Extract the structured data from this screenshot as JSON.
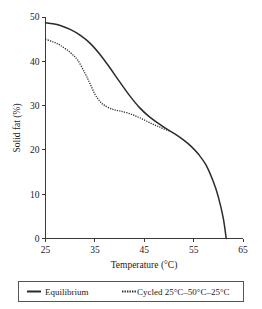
{
  "chart_data": {
    "type": "line",
    "title": "",
    "xlabel": "Temperature (°C)",
    "ylabel": "Solid fat (%)",
    "xlim": [
      25,
      65
    ],
    "ylim": [
      0,
      50
    ],
    "xticks": [
      25,
      35,
      45,
      55,
      65
    ],
    "yticks": [
      0,
      10,
      20,
      30,
      40,
      50
    ],
    "xtick_labels": [
      "25",
      "35",
      "45",
      "55",
      "65"
    ],
    "ytick_labels": [
      "0",
      "10",
      "20",
      "30",
      "40",
      "50"
    ],
    "grid": false,
    "legend_position": "below-axes",
    "series": [
      {
        "name": "Equilibrium",
        "style": "solid",
        "color": "#2b2b2b",
        "x": [
          25.0,
          26.5,
          28.0,
          30.0,
          32.0,
          34.0,
          36.0,
          38.0,
          40.0,
          42.0,
          44.0,
          46.0,
          48.0,
          50.0,
          51.5,
          53.0,
          54.5,
          56.0,
          57.5,
          59.0,
          60.0,
          61.0,
          61.6
        ],
        "y": [
          48.7,
          48.5,
          48.1,
          47.2,
          45.9,
          44.1,
          41.6,
          38.6,
          35.4,
          32.3,
          29.6,
          27.5,
          25.9,
          24.4,
          23.4,
          22.2,
          20.8,
          19.0,
          16.6,
          12.8,
          9.4,
          4.6,
          0.0
        ]
      },
      {
        "name": "Cycled 25°C–50°C–25°C",
        "style": "dotted",
        "color": "#2b2b2b",
        "x": [
          25.0,
          26.5,
          28.0,
          30.0,
          31.5,
          33.0,
          34.0,
          35.0,
          36.0,
          37.0,
          38.5,
          40.0,
          42.0,
          44.0,
          46.0,
          48.0,
          50.0
        ],
        "y": [
          45.0,
          44.4,
          43.6,
          42.0,
          40.3,
          37.3,
          35.0,
          32.6,
          31.0,
          30.0,
          29.2,
          28.8,
          28.2,
          27.3,
          26.2,
          25.2,
          24.3
        ]
      }
    ],
    "legend": [
      {
        "label": "Equilibrium",
        "style": "solid"
      },
      {
        "label": "Cycled 25°C–50°C–25°C",
        "style": "dotted"
      }
    ]
  }
}
